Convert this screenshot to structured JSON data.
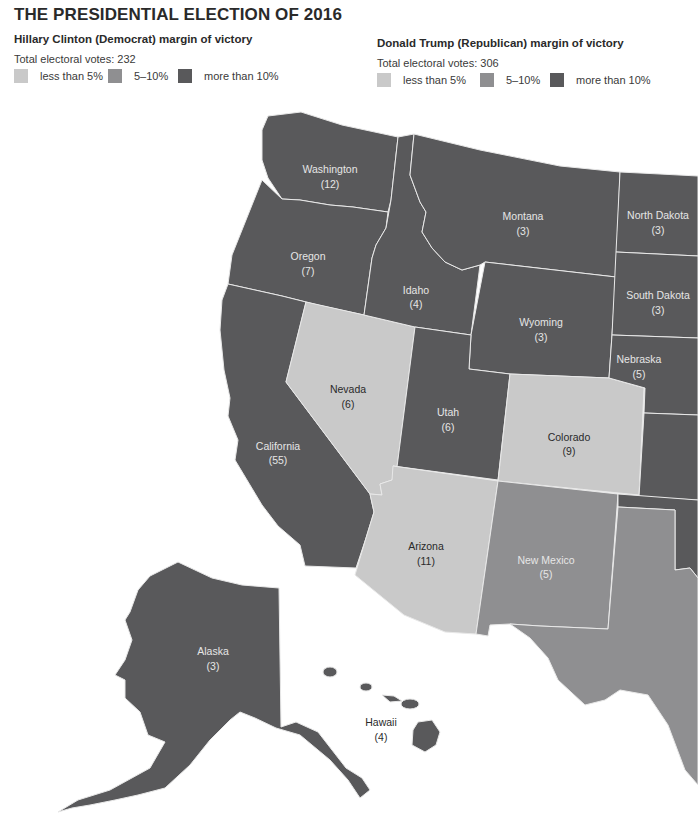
{
  "title": "THE PRESIDENTIAL ELECTION OF 2016",
  "legend": {
    "democrat": {
      "heading": "Hillary Clinton (Democrat) margin of victory",
      "total": "Total electoral votes: 232",
      "items": [
        {
          "label": "less than 5%",
          "color": "#c9c9c9"
        },
        {
          "label": "5–10%",
          "color": "#8f8f91"
        },
        {
          "label": "more than 10%",
          "color": "#59595b"
        }
      ]
    },
    "republican": {
      "heading": "Donald Trump (Republican) margin of victory",
      "total": "Total electoral votes: 306",
      "items": [
        {
          "label": "less than 5%",
          "color": "#c9c9c9"
        },
        {
          "label": "5–10%",
          "color": "#8f8f91"
        },
        {
          "label": "more than 10%",
          "color": "#59595b"
        }
      ]
    }
  },
  "colors": {
    "lt5": "#c9c9c9",
    "5to10": "#8f8f91",
    "gt10": "#59595b",
    "border": "#e8e8e8",
    "background": "#ffffff"
  },
  "states": [
    {
      "name": "Washington",
      "votes": "(12)",
      "margin": "gt10"
    },
    {
      "name": "Oregon",
      "votes": "(7)",
      "margin": "gt10"
    },
    {
      "name": "California",
      "votes": "(55)",
      "margin": "gt10"
    },
    {
      "name": "Idaho",
      "votes": "(4)",
      "margin": "gt10"
    },
    {
      "name": "Nevada",
      "votes": "(6)",
      "margin": "lt5"
    },
    {
      "name": "Montana",
      "votes": "(3)",
      "margin": "gt10"
    },
    {
      "name": "Wyoming",
      "votes": "(3)",
      "margin": "gt10"
    },
    {
      "name": "Utah",
      "votes": "(6)",
      "margin": "gt10"
    },
    {
      "name": "Colorado",
      "votes": "(9)",
      "margin": "lt5"
    },
    {
      "name": "Arizona",
      "votes": "(11)",
      "margin": "lt5"
    },
    {
      "name": "New Mexico",
      "votes": "(5)",
      "margin": "5to10"
    },
    {
      "name": "North Dakota",
      "votes": "(3)",
      "margin": "gt10"
    },
    {
      "name": "South Dakota",
      "votes": "(3)",
      "margin": "gt10"
    },
    {
      "name": "Nebraska",
      "votes": "(5)",
      "margin": "gt10"
    },
    {
      "name": "Alaska",
      "votes": "(3)",
      "margin": "gt10"
    },
    {
      "name": "Hawaii",
      "votes": "(4)",
      "margin": "gt10"
    }
  ]
}
